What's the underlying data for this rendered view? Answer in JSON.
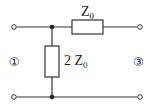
{
  "diagram": {
    "type": "circuit-two-port",
    "components": {
      "series_impedance": {
        "label": "Z",
        "subscript": "0"
      },
      "shunt_impedance": {
        "label": "2 Z",
        "subscript": "0"
      }
    },
    "ports": {
      "left": {
        "label": "①"
      },
      "right": {
        "label": "③"
      }
    },
    "colors": {
      "wire": "#333333",
      "background": "#ffffff"
    }
  }
}
